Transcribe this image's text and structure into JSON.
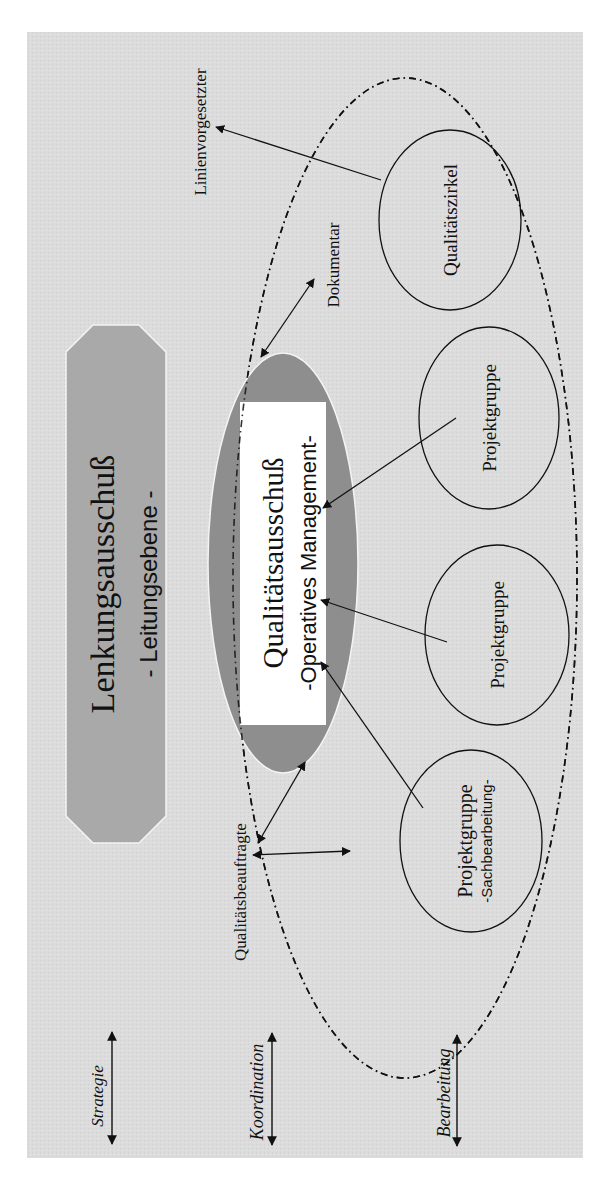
{
  "colors": {
    "page_background": "#ffffff",
    "panel_background": "#dcdcdc",
    "steering_committee_fill": "#a9a9a9",
    "quality_committee_fill": "#8e8e8e",
    "quality_committee_label_box": "#ffffff",
    "stroke": "#111111"
  },
  "diagram": {
    "steering_committee": {
      "title": "Lenkungsausschuß",
      "subtitle": "- Leitungsebene -"
    },
    "quality_committee": {
      "title": "Qualitätsausschuß",
      "subtitle": "-Operatives Management-"
    },
    "groups": [
      {
        "label": "Qualitätszirkel",
        "sublabel": ""
      },
      {
        "label": "Projektgruppe",
        "sublabel": ""
      },
      {
        "label": "Projektgruppe",
        "sublabel": ""
      },
      {
        "label": "Projektgruppe",
        "sublabel": "-Sachbearbeitung-"
      }
    ],
    "roles": {
      "line_manager": "Linienvorgesetzter",
      "documentalist": "Dokumentar",
      "quality_officer": "Qualitätsbeauftragte"
    },
    "levels": [
      {
        "label": "Strategie"
      },
      {
        "label": "Koordination"
      },
      {
        "label": "Bearbeitung"
      }
    ]
  }
}
